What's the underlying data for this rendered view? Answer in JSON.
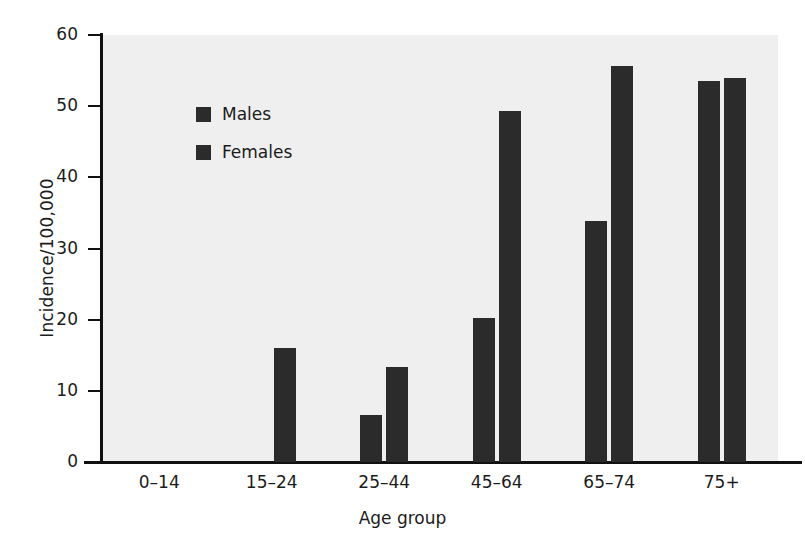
{
  "chart_data": {
    "type": "bar",
    "title": "",
    "subtitle": "",
    "xlabel": "Age group",
    "ylabel": "Incidence/100,000",
    "categories": [
      "0–14",
      "15–24",
      "25–44",
      "45–64",
      "65–74",
      "75+"
    ],
    "series": [
      {
        "name": "Males",
        "values": [
          0,
          0,
          6.6,
          20.2,
          33.8,
          53.5
        ]
      },
      {
        "name": "Females",
        "values": [
          0,
          16.0,
          13.4,
          49.3,
          55.6,
          54.0
        ]
      }
    ],
    "ylim": [
      0,
      60
    ],
    "yticks": [
      0,
      10,
      20,
      30,
      40,
      50,
      60
    ],
    "ytick_labels": [
      "0",
      "10",
      "20",
      "30",
      "40",
      "50",
      "60"
    ],
    "grid": false,
    "legend_position": "upper-left-inside",
    "bar_color": "#2b2b2b",
    "plot_background": "#efefef",
    "figure_background": "#ffffff",
    "axis_color": "#111111"
  },
  "axes": {
    "ylabel": "Incidence/100,000",
    "xlabel": "Age group"
  },
  "legend": {
    "items": [
      {
        "label": "Males",
        "color": "#2b2b2b"
      },
      {
        "label": "Females",
        "color": "#2b2b2b"
      }
    ]
  }
}
